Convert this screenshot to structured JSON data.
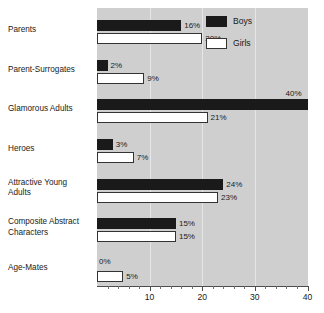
{
  "chart_data": {
    "type": "bar",
    "orientation": "horizontal",
    "title": "",
    "xlabel": "",
    "ylabel": "",
    "xlim": [
      0,
      40
    ],
    "grid": true,
    "gridlines": [
      10,
      20,
      30
    ],
    "legend_position": "top-right",
    "xticks_major": [
      10,
      20,
      30,
      40
    ],
    "xticks_minor": [
      2,
      4,
      6,
      8,
      12,
      14,
      16,
      18,
      22,
      24,
      26,
      28,
      32,
      34,
      36,
      38
    ],
    "xtick_labels": [
      "10",
      "20",
      "30",
      "40"
    ],
    "categories": [
      "Parents",
      "Parent-Surrogates",
      "Glamorous Adults",
      "Heroes",
      "Attractive Young Adults",
      "Composite Abstract Characters",
      "Age-Mates"
    ],
    "series": [
      {
        "name": "Boys",
        "color": "#1a1a1a",
        "values": [
          16,
          2,
          40,
          3,
          24,
          15,
          0
        ]
      },
      {
        "name": "Girls",
        "color": "#ffffff",
        "values": [
          20,
          9,
          21,
          7,
          23,
          15,
          5
        ]
      }
    ],
    "value_labels": {
      "boys": [
        "16%",
        "2%",
        "40%",
        "3%",
        "24%",
        "15%",
        "0%"
      ],
      "girls": [
        "20%",
        "9%",
        "21%",
        "7%",
        "23%",
        "15%",
        "5%"
      ]
    }
  },
  "category_labels": [
    {
      "line1": "Parents",
      "line2": ""
    },
    {
      "line1": "Parent-Surrogates",
      "line2": ""
    },
    {
      "line1": "Glamorous Adults",
      "line2": ""
    },
    {
      "line1": "Heroes",
      "line2": ""
    },
    {
      "line1": "Attractive Young",
      "line2": "Adults"
    },
    {
      "line1": "Composite Abstract",
      "line2": "Characters"
    },
    {
      "line1": "Age-Mates",
      "line2": ""
    }
  ],
  "legend": {
    "items": [
      {
        "label": "Boys",
        "swatch": "filled-black-swatch"
      },
      {
        "label": "Girls",
        "swatch": "outlined-white-swatch"
      }
    ]
  },
  "colors": {
    "plot_background": "#cfcfcf",
    "page_background": "#ffffff",
    "boys_bar": "#1a1a1a",
    "girls_bar": "#ffffff",
    "bar_outline": "#333333",
    "axis": "#4d4d4d",
    "gridline": "#e6e6e6",
    "text": "#1a1a1a"
  }
}
